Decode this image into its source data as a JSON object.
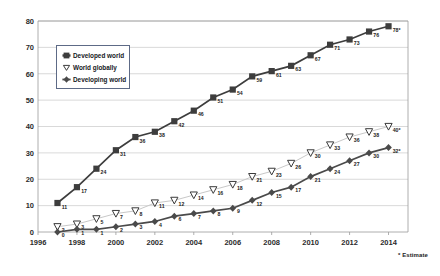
{
  "chart_data": {
    "type": "line",
    "title": "",
    "xlabel": "",
    "ylabel": "",
    "xlim": [
      1996,
      2015
    ],
    "ylim": [
      0,
      80
    ],
    "grid": true,
    "legend_position": "upper-left-inside",
    "xticks": [
      "1996",
      "1998",
      "2000",
      "2002",
      "2004",
      "2006",
      "2008",
      "2010",
      "2012",
      "2014"
    ],
    "xtick_values": [
      1996,
      1998,
      2000,
      2002,
      2004,
      2006,
      2008,
      2010,
      2012,
      2014
    ],
    "yticks": [
      "0",
      "10",
      "20",
      "30",
      "40",
      "50",
      "60",
      "70",
      "80"
    ],
    "ytick_values": [
      0,
      10,
      20,
      30,
      40,
      50,
      60,
      70,
      80
    ],
    "x": [
      1997,
      1998,
      1999,
      2000,
      2001,
      2002,
      2003,
      2004,
      2005,
      2006,
      2007,
      2008,
      2009,
      2010,
      2011,
      2012,
      2013,
      2014
    ],
    "series": [
      {
        "name": "Developed world",
        "marker": "square",
        "color": "#3d3d3d",
        "values": [
          11,
          17,
          24,
          31,
          36,
          38,
          42,
          46,
          51,
          54,
          59,
          61,
          63,
          67,
          71,
          73,
          76,
          78
        ],
        "labels": [
          "11",
          "17",
          "24",
          "31",
          "36",
          "38",
          "42",
          "46",
          "51",
          "54",
          "59",
          "61",
          "63",
          "67",
          "71",
          "73",
          "76",
          "78*"
        ]
      },
      {
        "name": "World globally",
        "marker": "triangle-down",
        "color": "#6f6f6f",
        "values": [
          2,
          3,
          5,
          7,
          8,
          11,
          12,
          14,
          16,
          18,
          21,
          23,
          26,
          30,
          33,
          36,
          38,
          40
        ],
        "labels": [
          "2",
          "3",
          "5",
          "7",
          "8",
          "11",
          "12",
          "14",
          "16",
          "18",
          "21",
          "23",
          "26",
          "30",
          "33",
          "36",
          "38",
          "40*"
        ]
      },
      {
        "name": "Developing world",
        "marker": "diamond",
        "color": "#4a4a4a",
        "values": [
          0,
          1,
          1,
          2,
          3,
          4,
          6,
          7,
          8,
          9,
          12,
          15,
          17,
          21,
          24,
          27,
          30,
          32
        ],
        "labels": [
          "0",
          "1",
          "1",
          "2",
          "3",
          "4",
          "6",
          "7",
          "8",
          "9",
          "12",
          "15",
          "17",
          "21",
          "24",
          "27",
          "30",
          "32*"
        ]
      }
    ],
    "annotations": [
      "* Estimate"
    ]
  },
  "legend": {
    "items": [
      {
        "label": "Developed world",
        "marker": "square"
      },
      {
        "label": "World globally",
        "marker": "triangle-down"
      },
      {
        "label": "Developing world",
        "marker": "diamond"
      }
    ]
  },
  "footnote": "* Estimate",
  "colors": {
    "grid": "#cfcfcf",
    "axis": "#9a9a9a",
    "developed": "#3d3d3d",
    "globally": "#6f6f6f",
    "developing": "#4a4a4a",
    "legend_border": "#5d6a86"
  }
}
